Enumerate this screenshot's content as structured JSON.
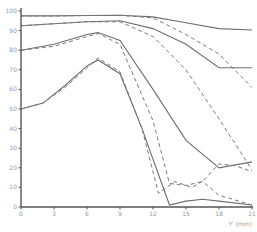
{
  "chart_data": {
    "type": "line",
    "title": "",
    "xlabel": "Y' (mm)",
    "ylabel": "",
    "xlim": [
      0,
      21
    ],
    "ylim": [
      0,
      100
    ],
    "x_ticks": [
      0,
      3,
      6,
      9,
      12,
      15,
      18,
      21
    ],
    "y_ticks": [
      0,
      10,
      20,
      30,
      40,
      50,
      60,
      70,
      80,
      90,
      100
    ],
    "grid": false,
    "legend": null,
    "series": [
      {
        "name": "curve-1-solid",
        "style": "solid",
        "x": [
          0,
          3,
          6,
          9,
          12,
          15,
          18,
          21
        ],
        "values": [
          97.5,
          97.5,
          97.7,
          97.8,
          97,
          94,
          91,
          90.3
        ]
      },
      {
        "name": "curve-1-dashed",
        "style": "dashed",
        "x": [
          0,
          3,
          6,
          9,
          12,
          15,
          18,
          21
        ],
        "values": [
          97.5,
          97.5,
          97.7,
          97.8,
          96.5,
          88,
          78,
          61
        ]
      },
      {
        "name": "curve-2-solid",
        "style": "solid",
        "x": [
          0,
          3,
          6,
          9,
          12,
          15,
          18,
          21
        ],
        "values": [
          92.5,
          93.5,
          94.5,
          95,
          91,
          83,
          71,
          71
        ]
      },
      {
        "name": "curve-2-dashed",
        "style": "dashed",
        "x": [
          0,
          3,
          6,
          9,
          12,
          15,
          18,
          21
        ],
        "values": [
          92.5,
          93.5,
          94.5,
          94.5,
          87,
          70,
          45,
          19
        ]
      },
      {
        "name": "curve-3-solid",
        "style": "solid",
        "x": [
          0,
          3,
          6,
          7,
          9,
          12,
          15,
          18,
          21
        ],
        "values": [
          80,
          83,
          88,
          89,
          85,
          60,
          34,
          20,
          23
        ]
      },
      {
        "name": "curve-3-dashed",
        "style": "dashed",
        "x": [
          0,
          3,
          6,
          7,
          9,
          12,
          13.5,
          15,
          16.5,
          18,
          19.5,
          21
        ],
        "values": [
          80,
          82,
          87,
          88.5,
          83,
          44,
          12,
          11,
          13,
          22,
          21,
          18
        ]
      },
      {
        "name": "curve-4-solid",
        "style": "solid",
        "x": [
          0,
          2,
          4,
          6,
          7,
          9,
          11,
          13.5,
          15,
          16.5,
          18,
          21
        ],
        "values": [
          50,
          53,
          62,
          72,
          75,
          68,
          40,
          1,
          3,
          4,
          3,
          1
        ]
      },
      {
        "name": "curve-4-dashed",
        "style": "dashed",
        "x": [
          0,
          2,
          4,
          6,
          7,
          9,
          11,
          12.5,
          14,
          15.5,
          16.5,
          18,
          21
        ],
        "values": [
          50,
          53,
          61,
          71,
          76,
          69,
          40,
          7,
          13,
          10,
          13,
          6,
          1
        ]
      }
    ]
  },
  "axes": {
    "x_label": "Y' (mm)",
    "x_tick_labels": [
      "0",
      "3",
      "6",
      "9",
      "12",
      "15",
      "18",
      "21"
    ],
    "y_tick_labels": [
      "0",
      "10",
      "20",
      "30",
      "40",
      "50",
      "60",
      "70",
      "80",
      "90",
      "100"
    ]
  }
}
